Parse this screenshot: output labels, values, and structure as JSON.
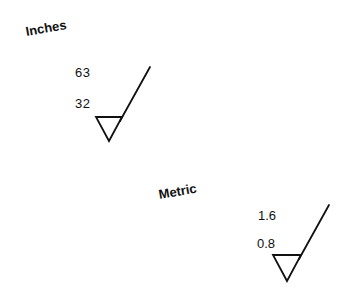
{
  "diagram": {
    "type": "surface-roughness-symbols",
    "groups": [
      {
        "unit_label": "Inches",
        "max_roughness": "63",
        "min_roughness": "32"
      },
      {
        "unit_label": "Metric",
        "max_roughness": "1.6",
        "min_roughness": "0.8"
      }
    ]
  }
}
